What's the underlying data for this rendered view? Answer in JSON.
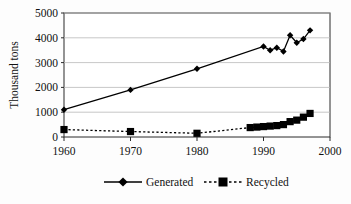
{
  "chart_data": {
    "type": "line",
    "title": "",
    "xlabel": "",
    "ylabel": "Thousand tons",
    "xlim": [
      1960,
      2000
    ],
    "ylim": [
      0,
      5000
    ],
    "xticks": [
      1960,
      1970,
      1980,
      1990,
      2000
    ],
    "xtick_labels": [
      "1960",
      "1970",
      "1980",
      "1990",
      "2000"
    ],
    "yticks": [
      0,
      1000,
      2000,
      3000,
      4000,
      5000
    ],
    "ytick_labels": [
      "0",
      "1000",
      "2000",
      "3000",
      "4000",
      "5000"
    ],
    "grid": "horizontal",
    "legend_position": "bottom",
    "series": [
      {
        "name": "Generated",
        "marker": "diamond",
        "linestyle": "solid",
        "color": "#000000",
        "x": [
          1960,
          1970,
          1980,
          1990,
          1991,
          1992,
          1993,
          1994,
          1995,
          1996,
          1997
        ],
        "values": [
          1100,
          1900,
          2750,
          3650,
          3500,
          3600,
          3450,
          4100,
          3800,
          3950,
          4300
        ]
      },
      {
        "name": "Recycled",
        "marker": "square",
        "linestyle": "dotted",
        "color": "#000000",
        "x": [
          1960,
          1970,
          1980,
          1988,
          1989,
          1990,
          1991,
          1992,
          1993,
          1994,
          1995,
          1996,
          1997
        ],
        "values": [
          300,
          220,
          150,
          380,
          400,
          420,
          440,
          460,
          500,
          620,
          680,
          800,
          950
        ]
      }
    ]
  },
  "axes": {
    "y_title": "Thousand tons",
    "y_tick_labels": [
      "5000",
      "4000",
      "3000",
      "2000",
      "1000",
      "0"
    ],
    "x_tick_labels": [
      "1960",
      "1970",
      "1980",
      "1990",
      "2000"
    ]
  },
  "legend": {
    "items": [
      {
        "label": "Generated",
        "marker": "diamond-marker",
        "style": "solid"
      },
      {
        "label": "Recycled",
        "marker": "square-marker",
        "style": "dotted"
      }
    ]
  },
  "colors": {
    "ink": "#000000",
    "grid": "#b9b9b9",
    "axis": "#2a2a2a",
    "background": "#fdfdfd"
  }
}
